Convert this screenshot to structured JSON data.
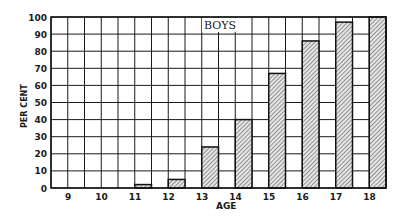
{
  "chart_data": {
    "type": "bar",
    "title": "BOYS",
    "xlabel": "AGE",
    "ylabel": "PER CENT",
    "categories": [
      "9",
      "10",
      "11",
      "12",
      "13",
      "14",
      "15",
      "16",
      "17",
      "18"
    ],
    "values": [
      0,
      0,
      2,
      5,
      24,
      40,
      67,
      86,
      97,
      100
    ],
    "ylim": [
      0,
      100
    ],
    "yticks": [
      0,
      10,
      20,
      30,
      40,
      50,
      60,
      70,
      80,
      90,
      100
    ],
    "grid": true,
    "legend": null,
    "bar_fill": "diagonal hatch",
    "colors": {
      "bar_fill": "#b8b8b8",
      "line": "#1a1a1a",
      "background": "#ffffff"
    }
  }
}
